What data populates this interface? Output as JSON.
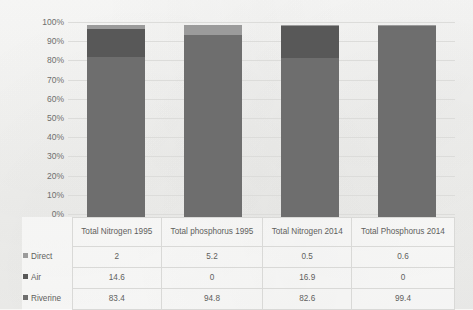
{
  "chart_data": {
    "type": "bar",
    "subtype": "100% stacked column",
    "title": "",
    "xlabel": "",
    "ylabel": "",
    "ylim": [
      0,
      100
    ],
    "grid": true,
    "legend_position": "table-left",
    "categories": [
      "Total Nitrogen 1995",
      "Total phosphorus 1995",
      "Total Nitrogen 2014",
      "Total Phosphorus 2014"
    ],
    "series": [
      {
        "name": "Direct",
        "values": [
          2,
          5.2,
          0.5,
          0.6
        ],
        "color": "#9b9b9b"
      },
      {
        "name": "Air",
        "values": [
          14.6,
          0,
          16.9,
          0
        ],
        "color": "#585858"
      },
      {
        "name": "Riverine",
        "values": [
          83.4,
          94.8,
          82.6,
          99.4
        ],
        "color": "#6e6e6e"
      }
    ],
    "ytick_labels": [
      "100%",
      "90%",
      "80%",
      "70%",
      "60%",
      "50%",
      "40%",
      "30%",
      "20%",
      "10%",
      "0%"
    ],
    "ytick_values": [
      100,
      90,
      80,
      70,
      60,
      50,
      40,
      30,
      20,
      10,
      0
    ]
  },
  "table": {
    "corner_label": "",
    "column_headers": [
      "Total Nitrogen 1995",
      "Total phosphorus 1995",
      "Total Nitrogen 2014",
      "Total Phosphorus 2014"
    ],
    "rows": [
      {
        "label": "Direct",
        "swatch": "direct-swatch",
        "values": [
          "2",
          "5.2",
          "0.5",
          "0.6"
        ]
      },
      {
        "label": "Air",
        "swatch": "air-swatch",
        "values": [
          "14.6",
          "0",
          "16.9",
          "0"
        ]
      },
      {
        "label": "Riverine",
        "swatch": "riverine-swatch",
        "values": [
          "83.4",
          "94.8",
          "82.6",
          "99.4"
        ]
      }
    ]
  },
  "colors": {
    "direct": "#9b9b9b",
    "air": "#585858",
    "riverine": "#6e6e6e",
    "gridline": "#dcdcda",
    "text": "#5f5f5d",
    "background": "#f7f7f5"
  }
}
